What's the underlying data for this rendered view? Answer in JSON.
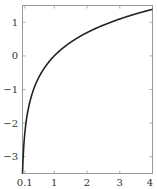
{
  "chart_data": {
    "type": "line",
    "title": "",
    "xlabel": "",
    "ylabel": "",
    "xlim": [
      0.03,
      4
    ],
    "ylim": [
      -3.5,
      1.5
    ],
    "grid": false,
    "legend": null,
    "x_ticks": [
      0.1,
      1,
      2,
      3,
      4
    ],
    "x_tick_labels": [
      "0.1",
      "1",
      "2",
      "3",
      "4"
    ],
    "y_ticks": [
      1,
      0,
      -1,
      -2,
      -3
    ],
    "y_tick_labels": [
      "1",
      "0",
      "−1",
      "−2",
      "−3"
    ],
    "series": [
      {
        "name": "ln(x)",
        "function": "y = ln(x)",
        "color": "#222222",
        "x": [
          0.03,
          0.05,
          0.1,
          0.2,
          0.3,
          0.5,
          0.75,
          1,
          1.5,
          2,
          2.5,
          3,
          3.5,
          4
        ],
        "y": [
          -3.51,
          -3.0,
          -2.3,
          -1.61,
          -1.2,
          -0.69,
          -0.29,
          0,
          0.41,
          0.69,
          0.92,
          1.1,
          1.25,
          1.39
        ]
      }
    ]
  },
  "style": {
    "frame_color": "#9a9a9a",
    "line_color": "#222222"
  }
}
